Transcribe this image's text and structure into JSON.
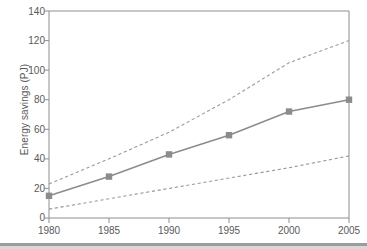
{
  "chart_data": {
    "type": "line",
    "title": "",
    "xlabel": "",
    "ylabel": "Energy savings (PJ)",
    "x": [
      1980,
      1985,
      1990,
      1995,
      2000,
      2005
    ],
    "xtick_labels": [
      "1980",
      "1985",
      "1990",
      "1995",
      "2000",
      "2005"
    ],
    "ytick_labels": [
      "0",
      "20",
      "40",
      "60",
      "80",
      "100",
      "120",
      "140"
    ],
    "ytick_values": [
      0,
      20,
      40,
      60,
      80,
      100,
      120,
      140
    ],
    "xlim": [
      1980,
      2005
    ],
    "ylim": [
      0,
      140
    ],
    "grid": false,
    "legend": "none",
    "series": [
      {
        "name": "Energy savings (central estimate)",
        "style": "solid",
        "marker": "square",
        "color": "#8c8c8e",
        "values": [
          15,
          28,
          43,
          56,
          72,
          80
        ]
      },
      {
        "name": "Upper bound",
        "style": "dashed",
        "marker": "none",
        "color": "#9a9a9c",
        "values": [
          23,
          40,
          58,
          80,
          105,
          120
        ]
      },
      {
        "name": "Lower bound",
        "style": "dashed",
        "marker": "none",
        "color": "#9a9a9c",
        "values": [
          6,
          13,
          20,
          27,
          34,
          42
        ]
      }
    ]
  },
  "axes": {
    "y_axis_title": "Energy savings (PJ)"
  }
}
